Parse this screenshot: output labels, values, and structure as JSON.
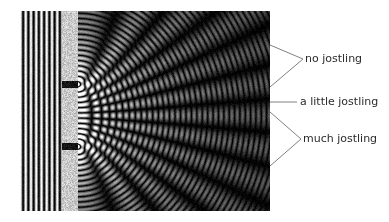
{
  "figure": {
    "kind": "double-slit-interference-simulation",
    "region": {
      "left": 20,
      "top": 11,
      "width": 250,
      "height": 200,
      "background_color": "#000000"
    },
    "incoming_waves": {
      "name": "plane-wave-region",
      "x_start": 0,
      "x_end": 42,
      "wavelength_px": 10.5,
      "bands": 5,
      "description": "vertical bright/dark plane-wave stripes travelling right"
    },
    "barrier": {
      "name": "double-slit-barrier",
      "x_start": 42,
      "x_end": 58,
      "color": "#b4b4b4",
      "speckle": true,
      "slits": [
        {
          "label": "upper-slit",
          "center_y": 73,
          "height": 7
        },
        {
          "label": "lower-slit",
          "center_y": 135,
          "height": 7
        }
      ]
    },
    "interference": {
      "name": "interference-region",
      "x_start": 58,
      "x_end": 250,
      "wavelength_px": 10.5,
      "source_separation_px": 62,
      "description": "circular waves from two slits producing radial interference fringes"
    },
    "colors": {
      "wave_bright": "#ffffff",
      "wave_dark": "#000000",
      "barrier": "#b4b4b4",
      "line": "#808080",
      "text": "#2b2b2b",
      "page_background": "#ffffff"
    }
  },
  "callouts": [
    {
      "id": "no-jostling",
      "label": "no jostling",
      "marker": "v-arrow",
      "apex": {
        "x": 303,
        "y": 59
      },
      "ends": [
        {
          "x": 270,
          "y": 45
        },
        {
          "x": 270,
          "y": 87
        }
      ]
    },
    {
      "id": "a-little-jostling",
      "label": "a little jostling",
      "marker": "straight-line",
      "apex": {
        "x": 297,
        "y": 102
      },
      "ends": [
        {
          "x": 270,
          "y": 102
        }
      ]
    },
    {
      "id": "much-jostling",
      "label": "much jostling",
      "marker": "v-arrow",
      "apex": {
        "x": 301,
        "y": 139
      },
      "ends": [
        {
          "x": 270,
          "y": 112
        },
        {
          "x": 270,
          "y": 166
        }
      ]
    }
  ]
}
